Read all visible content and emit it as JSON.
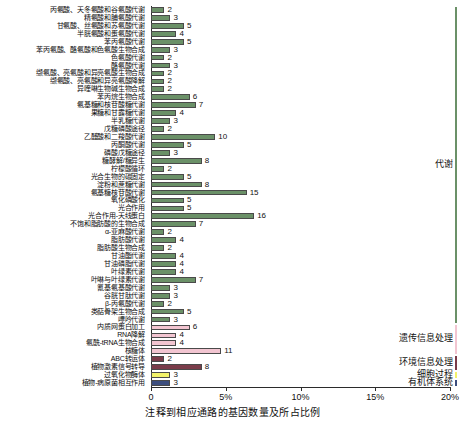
{
  "chart_data": {
    "type": "bar",
    "title": "",
    "xlabel": "注释到相应通路的基因数量及所占比例",
    "ylabel": "",
    "xlim": [
      0,
      20
    ],
    "xticks": [
      0,
      5,
      10,
      15,
      20
    ],
    "xtick_labels": [
      "0",
      "5%",
      "10%",
      "15%",
      "20%"
    ],
    "grid": false,
    "orientation": "horizontal",
    "categories": [
      "丙氨酸、天冬氨酸和谷氨酸代谢",
      "精氨酸和脯氨酸代谢",
      "甘氨酸、丝氨酸和苏氨酸代谢",
      "半胱氨酸和蛋氨酸代谢",
      "苯丙氨酸代谢",
      "苯丙氨酸、酪氨酸和色氨酸生物合成",
      "色氨酸代谢",
      "酪氨酸代谢",
      "缬氨酸、亮氨酸和异亮氨酸生物合成",
      "缬氨酸、亮氨酸和异亮氨酸降解",
      "异喹啉生物碱生物合成",
      "苯丙烷生物合成",
      "氨基糖和核苷酸糖代谢",
      "果糖和甘露糖代谢",
      "半乳糖代谢",
      "戊糖磷酸途径",
      "乙醛酸和二羧酸代谢",
      "丙酮酸代谢",
      "磷酸戊糖途径",
      "糖酵解/糖异生",
      "柠檬酸循环",
      "光合生物的碳固定",
      "淀粉和蔗糖代谢",
      "氨基糖核苷酸代谢",
      "氧化磷酸化",
      "光合作用",
      "光合作用-天线蛋白",
      "不饱和脂肪酸的生物合成",
      "α-亚麻酸代谢",
      "脂肪酸代谢",
      "脂肪酸生物合成",
      "甘油酯代谢",
      "甘油磷脂代谢",
      "叶绿素代谢",
      "叶啉与叶绿素代谢",
      "氰基氨基酸代谢",
      "谷胱甘肽代谢",
      "β-丙氨酸代谢",
      "类萜骨架生物合成",
      "嘌呤代谢",
      "内质网蛋白加工",
      "RNA降解",
      "氨酰-tRNA生物合成",
      "核糖体",
      "ABC转运体",
      "植物激素信号转导",
      "过氧化物酶体",
      "植物-病原菌相互作用"
    ],
    "values": [
      2,
      3,
      5,
      4,
      5,
      3,
      2,
      3,
      2,
      2,
      2,
      6,
      7,
      4,
      3,
      2,
      10,
      5,
      3,
      8,
      2,
      5,
      8,
      15,
      5,
      5,
      16,
      7,
      2,
      4,
      2,
      4,
      4,
      4,
      7,
      3,
      3,
      2,
      5,
      3,
      6,
      4,
      4,
      11,
      2,
      8,
      3,
      3
    ],
    "percents": [
      0.9,
      1.3,
      2.2,
      1.7,
      2.2,
      1.3,
      0.9,
      1.3,
      0.9,
      0.9,
      0.9,
      2.6,
      3.0,
      1.7,
      1.3,
      0.9,
      4.3,
      2.2,
      1.3,
      3.4,
      0.9,
      2.2,
      3.4,
      6.4,
      2.2,
      2.2,
      6.9,
      3.0,
      0.9,
      1.7,
      0.9,
      1.7,
      1.7,
      1.7,
      3.0,
      1.3,
      1.3,
      0.9,
      2.2,
      1.3,
      2.6,
      1.7,
      1.7,
      4.7,
      0.9,
      3.4,
      1.3,
      1.3
    ],
    "group_of_bar": [
      "metabolism",
      "metabolism",
      "metabolism",
      "metabolism",
      "metabolism",
      "metabolism",
      "metabolism",
      "metabolism",
      "metabolism",
      "metabolism",
      "metabolism",
      "metabolism",
      "metabolism",
      "metabolism",
      "metabolism",
      "metabolism",
      "metabolism",
      "metabolism",
      "metabolism",
      "metabolism",
      "metabolism",
      "metabolism",
      "metabolism",
      "metabolism",
      "metabolism",
      "metabolism",
      "metabolism",
      "metabolism",
      "metabolism",
      "metabolism",
      "metabolism",
      "metabolism",
      "metabolism",
      "metabolism",
      "metabolism",
      "metabolism",
      "metabolism",
      "metabolism",
      "metabolism",
      "metabolism",
      "genetic",
      "genetic",
      "genetic",
      "genetic",
      "environmental",
      "environmental",
      "cellular",
      "organismal"
    ],
    "groups": [
      {
        "key": "metabolism",
        "label": "代谢",
        "color": "#6b9168",
        "count": 40
      },
      {
        "key": "genetic",
        "label": "遗传信息处理",
        "color": "#f2c5d1",
        "count": 4
      },
      {
        "key": "environmental",
        "label": "环境信息处理",
        "color": "#7a3c4a",
        "count": 2
      },
      {
        "key": "cellular",
        "label": "细胞过程",
        "color": "#f2f26a",
        "count": 1
      },
      {
        "key": "organismal",
        "label": "有机体系统",
        "color": "#3c4d7d",
        "count": 1
      }
    ]
  },
  "colors": {
    "metabolism": "#6b9168",
    "genetic": "#f2c5d1",
    "environmental": "#7a3c4a",
    "cellular": "#f2f26a",
    "organismal": "#3c4d7d",
    "axis": "#2b2b2b",
    "text": "#111111"
  }
}
